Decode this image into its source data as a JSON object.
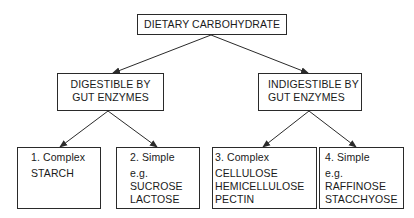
{
  "diagram": {
    "title": "DIETARY CARBOHYDRATE",
    "branches": [
      {
        "id": "digestible",
        "lines": [
          "DIGESTIBLE BY",
          "GUT ENZYMES"
        ],
        "children": [
          {
            "id": "complex-digestible",
            "lines": [
              "1. Complex",
              "STARCH"
            ]
          },
          {
            "id": "simple-digestible",
            "lines": [
              "2. Simple",
              "e.g.",
              "SUCROSE",
              "LACTOSE"
            ]
          }
        ]
      },
      {
        "id": "indigestible",
        "lines": [
          "INDIGESTIBLE BY",
          "GUT ENZYMES"
        ],
        "children": [
          {
            "id": "complex-indigestible",
            "lines": [
              "3. Complex",
              "CELLULOSE",
              "HEMICELLULOSE",
              "PECTIN"
            ]
          },
          {
            "id": "simple-indigestible",
            "lines": [
              "4. Simple",
              "e.g.",
              "RAFFINOSE",
              "STACCHYOSE"
            ]
          }
        ]
      }
    ],
    "colors": {
      "line": "#2a2a2a",
      "text": "#1a1a1a",
      "background": "#ffffff"
    }
  }
}
